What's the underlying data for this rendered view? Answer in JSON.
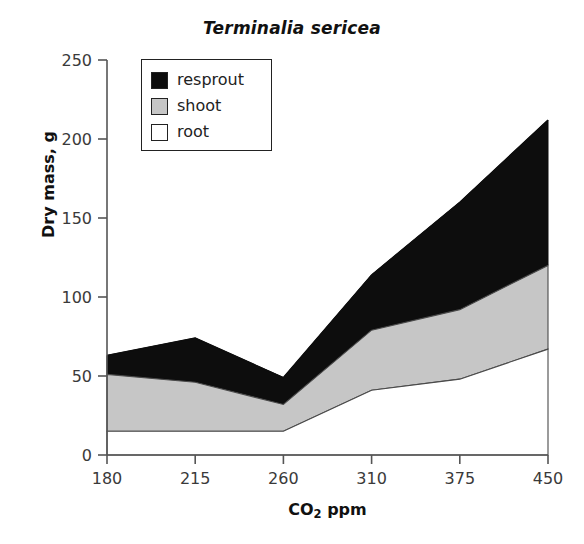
{
  "title": "Terminalia sericea",
  "axes": {
    "x_label_prefix": "CO",
    "x_label_sub": "2",
    "x_label_suffix": " ppm",
    "y_label": "Dry mass, g"
  },
  "legend": {
    "items": [
      {
        "label": "resprout",
        "color": "#0d0d0d"
      },
      {
        "label": "shoot",
        "color": "#c6c6c6"
      },
      {
        "label": "root",
        "color": "#ffffff"
      }
    ]
  },
  "ticks": {
    "y": [
      "0",
      "50",
      "100",
      "150",
      "200",
      "250"
    ],
    "x": [
      "180",
      "215",
      "260",
      "310",
      "375",
      "450"
    ]
  },
  "chart_data": {
    "type": "area",
    "title": "Terminalia sericea",
    "xlabel": "CO2 ppm",
    "ylabel": "Dry mass, g",
    "categories": [
      "180",
      "215",
      "260",
      "310",
      "375",
      "450"
    ],
    "x": [
      180,
      215,
      260,
      310,
      375,
      450
    ],
    "stacked": true,
    "ylim": [
      0,
      250
    ],
    "yticks": [
      0,
      50,
      100,
      150,
      200,
      250
    ],
    "grid": false,
    "legend_position": "upper-left-inside",
    "series": [
      {
        "name": "root",
        "color": "#ffffff",
        "values": [
          15,
          15,
          15,
          41,
          48,
          67
        ]
      },
      {
        "name": "shoot",
        "color": "#c6c6c6",
        "values": [
          36,
          31,
          17,
          38,
          44,
          53
        ]
      },
      {
        "name": "resprout",
        "color": "#0d0d0d",
        "values": [
          12,
          28,
          17,
          35,
          68,
          92
        ]
      }
    ],
    "cumulative": [
      {
        "name": "root_top",
        "values": [
          15,
          15,
          15,
          41,
          48,
          67
        ]
      },
      {
        "name": "shoot_top",
        "values": [
          51,
          46,
          32,
          79,
          92,
          120
        ]
      },
      {
        "name": "resprout_top",
        "values": [
          63,
          74,
          49,
          114,
          160,
          212
        ]
      }
    ]
  }
}
